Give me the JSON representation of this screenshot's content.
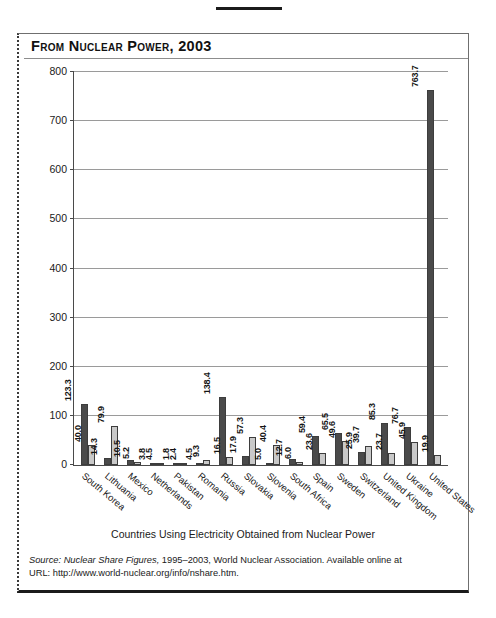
{
  "figure": {
    "title": "From Nuclear Power, 2003",
    "xaxis_title": "Countries Using Electricity Obtained from Nuclear Power",
    "source_label": "Source:",
    "source_italic": "Nuclear Share Figures,",
    "source_rest": " 1995–2003, World Nuclear Association. Available online at",
    "source_url": "URL: http://www.world-nuclear.org/info/nshare.htm."
  },
  "chart_data": {
    "type": "bar",
    "title": "From Nuclear Power, 2003",
    "xlabel": "Countries Using Electricity Obtained from Nuclear Power",
    "ylabel": "",
    "ylim": [
      0,
      800
    ],
    "yticks": [
      0,
      100,
      200,
      300,
      400,
      500,
      600,
      700,
      800
    ],
    "ytick_labels": [
      "0",
      "100",
      "200",
      "300",
      "400",
      "500",
      "600",
      "700",
      "800"
    ],
    "grid": true,
    "legend": "none",
    "categories": [
      "South Korea",
      "Lithuania",
      "Mexico",
      "Netherlands",
      "Pakistan",
      "Romania",
      "Russia",
      "Slovakia",
      "Slovenia",
      "South Africa",
      "Spain",
      "Sweden",
      "Switzerland",
      "United Kingdom",
      "Ukraine",
      "United States"
    ],
    "series": [
      {
        "name": "dark",
        "color": "#4a4a4a",
        "values": [
          123.3,
          14.3,
          10.5,
          3.8,
          1.8,
          4.5,
          138.4,
          17.9,
          5.0,
          12.7,
          59.4,
          65.5,
          25.9,
          85.3,
          76.7,
          763.7
        ]
      },
      {
        "name": "light",
        "color": "#c9c9c9",
        "values": [
          40.0,
          79.9,
          5.2,
          4.5,
          2.4,
          9.3,
          16.5,
          57.3,
          40.4,
          6.0,
          23.6,
          49.6,
          39.7,
          23.7,
          45.9,
          19.9
        ]
      }
    ],
    "value_labels": [
      [
        "123.3",
        "40.0"
      ],
      [
        "14.3",
        "79.9"
      ],
      [
        "10.5",
        "5.2"
      ],
      [
        "3.8",
        "4.5"
      ],
      [
        "1.8",
        "2.4"
      ],
      [
        "4.5",
        "9.3"
      ],
      [
        "138.4",
        "16.5"
      ],
      [
        "17.9",
        "57.3"
      ],
      [
        "5.0",
        "40.4"
      ],
      [
        "12.7",
        "6.0"
      ],
      [
        "59.4",
        "23.6"
      ],
      [
        "65.5",
        "49.6"
      ],
      [
        "25.9",
        "39.7"
      ],
      [
        "85.3",
        "23.7"
      ],
      [
        "76.7",
        "45.9"
      ],
      [
        "763.7",
        "19.9"
      ]
    ]
  }
}
